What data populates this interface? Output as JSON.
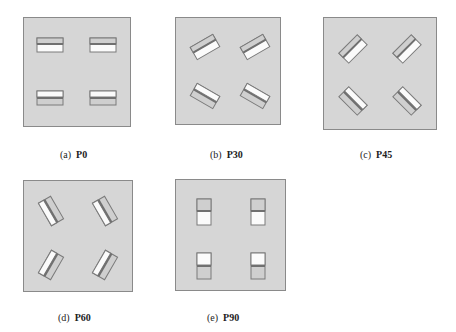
{
  "figure": {
    "colors": {
      "background": "#ffffff",
      "panel_fill": "#d6d6d6",
      "panel_border": "#8a8a8a",
      "rect_border": "#7a7a7a",
      "white_half": "#fbfbfb",
      "gray_half": "#cfcfcf",
      "band": "#707070"
    },
    "panels": [
      {
        "tag": "(a)",
        "name": "P0",
        "angle": 0
      },
      {
        "tag": "(b)",
        "name": "P30",
        "angle": 30
      },
      {
        "tag": "(c)",
        "name": "P45",
        "angle": 45
      },
      {
        "tag": "(d)",
        "name": "P60",
        "angle": 60
      },
      {
        "tag": "(e)",
        "name": "P90",
        "angle": 90
      }
    ]
  }
}
